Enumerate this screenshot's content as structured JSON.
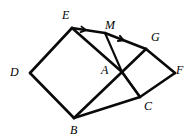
{
  "figure": {
    "kind": "geometry-diagram",
    "canvas": {
      "width": 191,
      "height": 140
    },
    "stroke_color": "#0a0a0a",
    "background_color": "#ffffff",
    "points": [
      {
        "id": "D",
        "label": "D",
        "x": 30,
        "y": 73,
        "label_x": 10,
        "label_y": 66
      },
      {
        "id": "E",
        "label": "E",
        "x": 72,
        "y": 28,
        "label_x": 62,
        "label_y": 9
      },
      {
        "id": "A",
        "label": "A",
        "x": 122,
        "y": 72,
        "label_x": 101,
        "label_y": 64
      },
      {
        "id": "B",
        "label": "B",
        "x": 74,
        "y": 118,
        "label_x": 70,
        "label_y": 124
      },
      {
        "id": "M",
        "label": "M",
        "x": 105,
        "y": 33,
        "label_x": 105,
        "label_y": 19
      },
      {
        "id": "G",
        "label": "G",
        "x": 146,
        "y": 49,
        "label_x": 151,
        "label_y": 31
      },
      {
        "id": "F",
        "label": "F",
        "x": 175,
        "y": 73,
        "label_x": 176,
        "label_y": 64
      },
      {
        "id": "C",
        "label": "C",
        "x": 140,
        "y": 97,
        "label_x": 144,
        "label_y": 100
      }
    ],
    "segments": [
      {
        "name": "edge-D-E",
        "from": "D",
        "to": "E",
        "weight": "thick"
      },
      {
        "name": "edge-E-A",
        "from": "E",
        "to": "A",
        "weight": "thick"
      },
      {
        "name": "edge-A-B",
        "from": "A",
        "to": "B",
        "weight": "thick"
      },
      {
        "name": "edge-B-D",
        "from": "B",
        "to": "D",
        "weight": "thick"
      },
      {
        "name": "edge-A-G",
        "from": "A",
        "to": "G",
        "weight": "thick"
      },
      {
        "name": "edge-G-F",
        "from": "G",
        "to": "F",
        "weight": "thick"
      },
      {
        "name": "edge-F-C",
        "from": "F",
        "to": "C",
        "weight": "thick"
      },
      {
        "name": "edge-C-A",
        "from": "C",
        "to": "A",
        "weight": "thick"
      },
      {
        "name": "edge-E-M",
        "from": "E",
        "to": "M",
        "weight": "thick"
      },
      {
        "name": "edge-M-G",
        "from": "M",
        "to": "G",
        "weight": "thick"
      },
      {
        "name": "edge-M-A",
        "from": "M",
        "to": "A",
        "weight": "thin"
      },
      {
        "name": "edge-B-C",
        "from": "B",
        "to": "C",
        "weight": "thick"
      },
      {
        "name": "edge-A-C-median",
        "from": "A",
        "to": "C",
        "weight": "thin"
      }
    ],
    "tick_arrows": [
      {
        "name": "arrow-on-EM",
        "on_segment": "edge-E-M",
        "t": 0.42,
        "direction": "toward-E"
      },
      {
        "name": "arrow-on-MG",
        "on_segment": "edge-M-G",
        "t": 0.45,
        "direction": "toward-M"
      }
    ]
  }
}
